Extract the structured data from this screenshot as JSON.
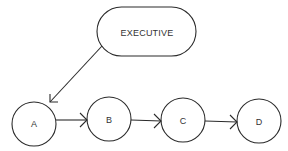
{
  "diagram": {
    "type": "flow",
    "colors": {
      "stroke": "#2a2a2a",
      "text": "#333333",
      "background": "#ffffff"
    },
    "executive": {
      "label": "EXECUTIVE",
      "shape": "pill",
      "x": 97,
      "y": 7,
      "width": 99,
      "height": 49
    },
    "nodes": [
      {
        "id": "A",
        "label": "A",
        "cx": 34,
        "cy": 124,
        "r": 22
      },
      {
        "id": "B",
        "label": "B",
        "cx": 109,
        "cy": 119,
        "r": 22
      },
      {
        "id": "C",
        "label": "C",
        "cx": 183,
        "cy": 120,
        "r": 22
      },
      {
        "id": "D",
        "label": "D",
        "cx": 259,
        "cy": 121,
        "r": 22
      }
    ],
    "edges": [
      {
        "from": "EXECUTIVE",
        "to": "A"
      },
      {
        "from": "A",
        "to": "B"
      },
      {
        "from": "B",
        "to": "C"
      },
      {
        "from": "C",
        "to": "D"
      }
    ]
  }
}
